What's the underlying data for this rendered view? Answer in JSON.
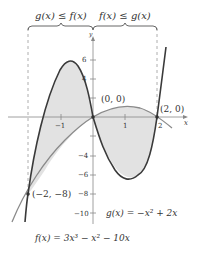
{
  "diagram": {
    "type": "function-graph",
    "top_labels": {
      "left": "g(x) ≤ f(x)",
      "right": "f(x) ≤ g(x)"
    },
    "axes": {
      "x_label": "x",
      "y_label": "y",
      "x_ticks": [
        "−1",
        "1",
        "2"
      ],
      "y_ticks": [
        "6",
        "4",
        "−4",
        "−6",
        "−8",
        "−10"
      ]
    },
    "points": [
      {
        "label": "(0, 0)"
      },
      {
        "label": "(2, 0)"
      },
      {
        "label": "(−2, −8)"
      }
    ],
    "functions": {
      "f": "f(x) = 3x³ − x² − 10x",
      "g": "g(x) = −x² + 2x"
    },
    "colors": {
      "curve_f": "#3a3a3a",
      "curve_g": "#8a8a8a",
      "shade": "#e2e2e2",
      "axis": "#888888"
    }
  }
}
